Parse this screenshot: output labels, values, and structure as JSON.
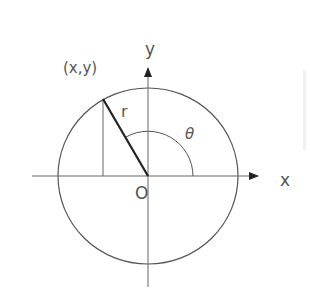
{
  "diagram": {
    "labels": {
      "point": "(x,y)",
      "radius": "r",
      "angle": "θ",
      "origin": "O",
      "x_axis": "x",
      "y_axis": "y"
    },
    "colors": {
      "background": "#ffffff",
      "stroke": "#555555",
      "radius_stroke": "#222222"
    },
    "geometry": {
      "origin": [
        148,
        176
      ],
      "circle_rx": 90,
      "circle_ry": 88,
      "point_on_circle": [
        103,
        99
      ],
      "angle_arc_radius": 45
    }
  }
}
